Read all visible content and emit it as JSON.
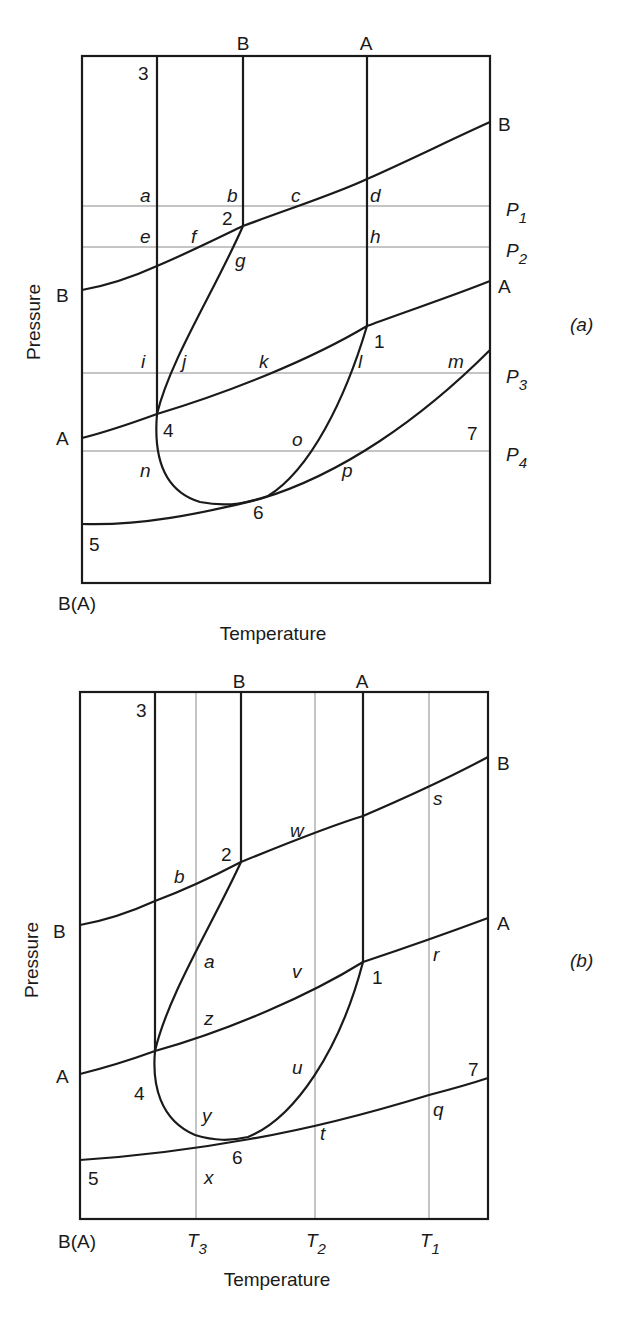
{
  "panel_a": {
    "tag": "(a)",
    "ylabel": "Pressure",
    "xlabel": "Temperature",
    "origin_label": "B(A)",
    "top_labels": {
      "b": "B",
      "a": "A"
    },
    "left_labels": {
      "b": "B",
      "a": "A"
    },
    "right_labels": {
      "b": "B",
      "a": "A"
    },
    "points": {
      "p1": "1",
      "p2": "2",
      "p3": "3",
      "p4": "4",
      "p5": "5",
      "p6": "6",
      "p7": "7"
    },
    "isobars": [
      "P1",
      "P2",
      "P3",
      "P4"
    ],
    "isobar_subs": [
      "1",
      "2",
      "3",
      "4"
    ],
    "letters": {
      "a": "a",
      "b": "b",
      "c": "c",
      "d": "d",
      "e": "e",
      "f": "f",
      "g": "g",
      "h": "h",
      "i": "i",
      "j": "j",
      "k": "k",
      "l": "l",
      "m": "m",
      "n": "n",
      "o": "o",
      "p": "p"
    }
  },
  "panel_b": {
    "tag": "(b)",
    "ylabel": "Pressure",
    "xlabel": "Temperature",
    "origin_label": "B(A)",
    "top_labels": {
      "b": "B",
      "a": "A"
    },
    "left_labels": {
      "b": "B",
      "a": "A"
    },
    "right_labels": {
      "b": "B",
      "a": "A"
    },
    "points": {
      "p1": "1",
      "p2": "2",
      "p3": "3",
      "p4": "4",
      "p5": "5",
      "p6": "6",
      "p7": "7"
    },
    "isotherms": [
      "T3",
      "T2",
      "T1"
    ],
    "isotherm_subs": [
      "3",
      "2",
      "1"
    ],
    "letters": {
      "a": "a",
      "b": "b",
      "q": "q",
      "r": "r",
      "s": "s",
      "t": "t",
      "u": "u",
      "v": "v",
      "w": "w",
      "x": "x",
      "y": "y",
      "z": "z"
    }
  }
}
